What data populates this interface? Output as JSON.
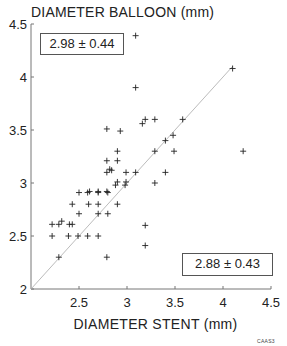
{
  "chart_data": {
    "type": "scatter",
    "title": "",
    "xlabel": "DIAMETER STENT (mm)",
    "ylabel": "DIAMETER BALLOON (mm)",
    "xlim": [
      2,
      4.5
    ],
    "ylim": [
      2,
      4.5
    ],
    "x_ticks": [
      2.5,
      3,
      3.5,
      4,
      4.5
    ],
    "y_ticks": [
      2,
      2.5,
      3,
      3.5,
      4,
      4.5
    ],
    "x_tick_labels": [
      "2.5",
      "3",
      "3.5",
      "4",
      "4.5"
    ],
    "y_tick_labels": [
      "2",
      "2.5",
      "3",
      "3.5",
      "4",
      "4.5"
    ],
    "grid": false,
    "legend": null,
    "reference_line": {
      "type": "identity",
      "from": [
        2,
        2
      ],
      "to": [
        4.1,
        4.1
      ],
      "style": "thin gray"
    },
    "annotations": [
      {
        "text": "2.98 ± 0.44",
        "meaning": "balloon mean ± SD",
        "position": "top-left"
      },
      {
        "text": "2.88 ± 0.43",
        "meaning": "stent mean ± SD",
        "position": "bottom-right"
      }
    ],
    "series": [
      {
        "name": "lesions",
        "marker": "+",
        "points": [
          [
            3.09,
            4.39
          ],
          [
            3.09,
            3.9
          ],
          [
            4.1,
            4.08
          ],
          [
            4.21,
            3.3
          ],
          [
            3.19,
            3.6
          ],
          [
            3.29,
            3.6
          ],
          [
            3.58,
            3.6
          ],
          [
            3.16,
            3.56
          ],
          [
            2.79,
            3.51
          ],
          [
            2.93,
            3.49
          ],
          [
            3.48,
            3.45
          ],
          [
            3.4,
            3.4
          ],
          [
            2.9,
            3.3
          ],
          [
            3.29,
            3.3
          ],
          [
            3.49,
            3.3
          ],
          [
            2.79,
            3.21
          ],
          [
            2.9,
            3.21
          ],
          [
            2.79,
            3.1
          ],
          [
            2.82,
            3.13
          ],
          [
            2.84,
            3.12
          ],
          [
            2.99,
            3.1
          ],
          [
            3.09,
            3.1
          ],
          [
            3.4,
            3.1
          ],
          [
            2.9,
            3.01
          ],
          [
            2.88,
            2.98
          ],
          [
            2.99,
            3.01
          ],
          [
            2.98,
            2.98
          ],
          [
            3.29,
            3.0
          ],
          [
            2.61,
            2.92
          ],
          [
            2.7,
            2.92
          ],
          [
            2.79,
            2.92
          ],
          [
            2.5,
            2.91
          ],
          [
            2.59,
            2.91
          ],
          [
            2.7,
            2.91
          ],
          [
            2.8,
            2.91
          ],
          [
            2.43,
            2.8
          ],
          [
            2.6,
            2.8
          ],
          [
            2.7,
            2.8
          ],
          [
            2.9,
            2.8
          ],
          [
            2.5,
            2.71
          ],
          [
            2.7,
            2.71
          ],
          [
            2.8,
            2.71
          ],
          [
            2.22,
            2.61
          ],
          [
            2.29,
            2.61
          ],
          [
            2.32,
            2.64
          ],
          [
            2.4,
            2.61
          ],
          [
            2.43,
            2.61
          ],
          [
            2.22,
            2.5
          ],
          [
            2.39,
            2.5
          ],
          [
            2.49,
            2.5
          ],
          [
            2.59,
            2.5
          ],
          [
            2.7,
            2.5
          ],
          [
            3.19,
            2.6
          ],
          [
            3.19,
            2.41
          ],
          [
            2.29,
            2.3
          ],
          [
            2.79,
            2.3
          ]
        ]
      }
    ]
  },
  "labels": {
    "ylabel": "DIAMETER BALLOON (mm)",
    "xlabel": "DIAMETER STENT (mm)",
    "stat_top": "2.98 ± 0.44",
    "stat_bottom": "2.88 ± 0.43",
    "figure_code": "CAAS3"
  },
  "colors": {
    "axis": "#777777",
    "marker": "#222222",
    "identity_line": "#aaaaaa",
    "text": "#222222"
  },
  "layout": {
    "x0_px": 31,
    "x_px_per_unit": 96,
    "y0_px": 289,
    "y_px_per_unit": 106
  }
}
